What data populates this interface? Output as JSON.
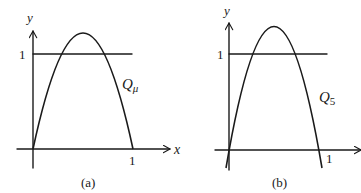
{
  "figure": {
    "panels": [
      {
        "id": "a",
        "caption": "(a)",
        "y_axis_label": "y",
        "x_axis_label": "x",
        "y_tick_label": "1",
        "x_tick_label": "1",
        "curve_label_main": "Q",
        "curve_label_sub": "μ",
        "description": "Parabola from origin to x=1 with peak above horizontal line y=1"
      },
      {
        "id": "b",
        "caption": "(b)",
        "y_axis_label": "y",
        "x_axis_label": "",
        "y_tick_label": "1",
        "x_tick_label": "1",
        "curve_label_main": "Q",
        "curve_label_sub": "5",
        "description": "Parabola Q_5 extending below x-axis at both ends, peak above y=1"
      }
    ]
  }
}
